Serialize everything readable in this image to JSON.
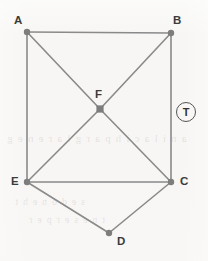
{
  "figure": {
    "kind": "undirected-graph-diagram",
    "width": 208,
    "height": 261,
    "background_color": "#f7f6f4",
    "edge_color": "#8a8a8a",
    "vertex_color": "#7d7d7d",
    "label_color": "#3b3b3b"
  },
  "vertices": [
    {
      "id": "A",
      "label": "A",
      "x": 27,
      "y": 32,
      "marker": "dot"
    },
    {
      "id": "B",
      "label": "B",
      "x": 171,
      "y": 33,
      "marker": "dot"
    },
    {
      "id": "F",
      "label": "F",
      "x": 100,
      "y": 109,
      "marker": "square"
    },
    {
      "id": "E",
      "label": "E",
      "x": 27,
      "y": 182,
      "marker": "dot"
    },
    {
      "id": "C",
      "label": "C",
      "x": 171,
      "y": 182,
      "marker": "dot"
    },
    {
      "id": "D",
      "label": "D",
      "x": 109,
      "y": 233,
      "marker": "dot"
    }
  ],
  "edges": [
    {
      "from": "A",
      "to": "B"
    },
    {
      "from": "A",
      "to": "E"
    },
    {
      "from": "A",
      "to": "F"
    },
    {
      "from": "F",
      "to": "C"
    },
    {
      "from": "B",
      "to": "C"
    },
    {
      "from": "B",
      "to": "F"
    },
    {
      "from": "F",
      "to": "E"
    },
    {
      "from": "E",
      "to": "C"
    },
    {
      "from": "E",
      "to": "D"
    },
    {
      "from": "D",
      "to": "C"
    }
  ],
  "annotation": {
    "tag_label": "T",
    "tag_shape": "circled-letter",
    "x": 186,
    "y": 112
  },
  "bleed_through_text": {
    "row1": "a n i   l a c i   h p a r g   l a r e n e g",
    "row2": "s e d o n   e h t",
    "row3": "t n e s e r p e r"
  }
}
